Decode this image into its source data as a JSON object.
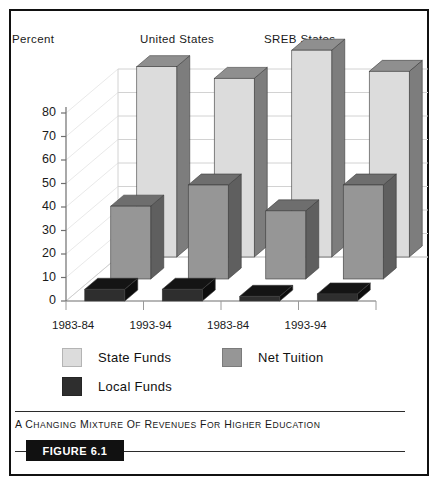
{
  "figure": {
    "caption": "A Changing Mixture of Revenues for Higher Education",
    "badge": "FIGURE 6.1"
  },
  "header": {
    "y_axis_title": "Percent",
    "group_labels": [
      "United States",
      "SREB States"
    ]
  },
  "colors": {
    "state_funds": "#dcdcdc",
    "state_funds_top": "#8f8f8f",
    "state_funds_side": "#7d7d7d",
    "net_tuition": "#969696",
    "net_tuition_top": "#6e6e6e",
    "net_tuition_side": "#5f5f5f",
    "local_funds": "#2e2e2e",
    "local_funds_top": "#141414",
    "local_funds_side": "#0d0d0d",
    "grid": "#d2d2d2",
    "axis": "#8a8a8a",
    "frame": "#111111"
  },
  "chart_data": {
    "type": "bar",
    "title": "A Changing Mixture of Revenues for Higher Education",
    "xlabel": "",
    "ylabel": "Percent",
    "ylim": [
      0,
      80
    ],
    "yticks": [
      0,
      10,
      20,
      30,
      40,
      50,
      60,
      70,
      80
    ],
    "grid": true,
    "legend_position": "bottom",
    "three_d": true,
    "categories": [
      "1983-84",
      "1993-94",
      "1983-84",
      "1993-94"
    ],
    "group_labels": [
      "United States",
      "SREB States"
    ],
    "category_groups": [
      "United States",
      "United States",
      "SREB States",
      "SREB States"
    ],
    "series": [
      {
        "name": "State Funds",
        "values": [
          81,
          76,
          88,
          79
        ]
      },
      {
        "name": "Net Tuition",
        "values": [
          31,
          40,
          29,
          40
        ]
      },
      {
        "name": "Local Funds",
        "values": [
          5,
          5,
          2,
          3
        ]
      }
    ]
  }
}
